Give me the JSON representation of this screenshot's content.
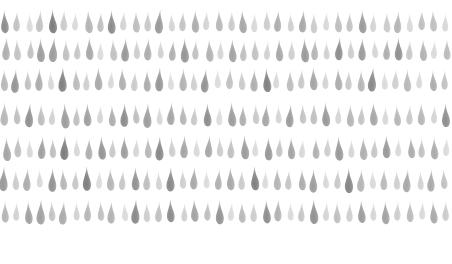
{
  "artwork": {
    "title": "Watercolor raindrop repeat pattern",
    "medium": "watercolor",
    "motif_name": "teardrop",
    "background_color": "#ffffff",
    "canvas": {
      "width": 452,
      "height": 264
    },
    "grid": {
      "columns": 38,
      "rows": 7,
      "column_spacing": 11.9,
      "row_spacing": 30.2,
      "first_row_center_y": 22,
      "first_column_center_x": 5
    },
    "motif": {
      "base_width": 9,
      "base_height": 24,
      "tip_direction": "up",
      "bulb_direction": "down"
    },
    "palette": {
      "lightest": "#dcdcdc",
      "light": "#cfcfcf",
      "mid_light": "#bdbdbd",
      "mid": "#ababab",
      "mid_dark": "#9a9a9a",
      "dark": "#8a8a8a",
      "darkest": "#7b7b7b"
    },
    "rows": [
      {
        "index": 0,
        "center_y": 22,
        "x_offset": 0,
        "shades": [
          5,
          2,
          1,
          3,
          6,
          2,
          1,
          4,
          2,
          5,
          1,
          3,
          2,
          6,
          1,
          2,
          4,
          1,
          3,
          2,
          5,
          1,
          2,
          3,
          1,
          4,
          2,
          1,
          3,
          2,
          5,
          1,
          2,
          4,
          1,
          2,
          3,
          1
        ],
        "sizes": [
          1.0,
          0.88,
          0.82,
          0.95,
          1.05,
          0.9,
          0.8,
          1.0,
          0.86,
          1.02,
          0.84,
          0.93,
          0.88,
          1.06,
          0.8,
          0.87,
          0.98,
          0.82,
          0.92,
          0.86,
          1.0,
          0.83,
          0.88,
          0.94,
          0.81,
          0.97,
          0.87,
          0.8,
          0.92,
          0.85,
          1.0,
          0.82,
          0.88,
          0.96,
          0.83,
          0.87,
          0.93,
          0.8
        ],
        "tilts": [
          -3,
          2,
          -1,
          4,
          -2,
          1,
          3,
          -4,
          2,
          -1,
          3,
          -2,
          1,
          4,
          -3,
          2,
          -1,
          3,
          -2,
          1,
          -4,
          2,
          -1,
          3,
          -2,
          4,
          -1,
          2,
          -3,
          1,
          -2,
          3,
          -1,
          4,
          -2,
          1,
          -3,
          2
        ]
      },
      {
        "index": 1,
        "center_y": 50,
        "x_offset": 1,
        "shades": [
          4,
          3,
          2,
          5,
          6,
          3,
          2,
          4,
          1,
          3,
          5,
          2,
          4,
          1,
          3,
          6,
          2,
          4,
          1,
          5,
          2,
          3,
          1,
          4,
          2,
          6,
          3,
          1,
          5,
          2,
          4,
          1,
          3,
          5,
          2,
          4,
          1,
          3
        ],
        "sizes": [
          1.0,
          0.92,
          0.85,
          1.04,
          1.08,
          0.9,
          0.84,
          0.99,
          0.82,
          0.94,
          1.02,
          0.86,
          0.97,
          0.8,
          0.9,
          1.06,
          0.85,
          0.98,
          0.83,
          1.0,
          0.87,
          0.92,
          0.81,
          0.96,
          0.86,
          1.05,
          0.91,
          0.8,
          1.0,
          0.85,
          0.97,
          0.82,
          0.9,
          1.01,
          0.86,
          0.95,
          0.81,
          0.9
        ],
        "tilts": [
          2,
          -3,
          1,
          -2,
          4,
          -1,
          3,
          -2,
          1,
          -4,
          2,
          -1,
          3,
          -2,
          4,
          -1,
          2,
          -3,
          1,
          -2,
          3,
          -1,
          4,
          -2,
          1,
          -3,
          2,
          -1,
          3,
          -2,
          1,
          -4,
          2,
          -1,
          3,
          -2,
          4,
          -1
        ]
      },
      {
        "index": 2,
        "center_y": 80,
        "x_offset": -1,
        "shades": [
          3,
          5,
          2,
          4,
          1,
          6,
          3,
          2,
          5,
          1,
          4,
          2,
          3,
          6,
          1,
          4,
          2,
          5,
          1,
          3,
          2,
          4,
          6,
          1,
          3,
          2,
          5,
          1,
          4,
          2,
          3,
          6,
          1,
          2,
          4,
          1,
          3,
          2
        ],
        "sizes": [
          0.95,
          1.03,
          0.86,
          0.98,
          0.81,
          1.07,
          0.92,
          0.84,
          1.0,
          0.8,
          0.96,
          0.87,
          0.93,
          1.05,
          0.82,
          0.99,
          0.85,
          1.01,
          0.83,
          0.91,
          0.86,
          0.97,
          1.04,
          0.8,
          0.92,
          0.85,
          1.0,
          0.82,
          0.96,
          0.86,
          0.93,
          1.06,
          0.81,
          0.87,
          0.98,
          0.8,
          0.91,
          0.85
        ],
        "tilts": [
          -2,
          3,
          -1,
          2,
          -4,
          1,
          -3,
          2,
          -1,
          4,
          -2,
          3,
          -1,
          2,
          -3,
          1,
          -2,
          4,
          -1,
          3,
          -2,
          1,
          -4,
          2,
          -1,
          3,
          -2,
          1,
          -3,
          2,
          -1,
          4,
          -2,
          3,
          -1,
          2,
          -3,
          1
        ]
      },
      {
        "index": 3,
        "center_y": 115,
        "x_offset": 0,
        "shades": [
          4,
          2,
          5,
          3,
          1,
          6,
          2,
          4,
          1,
          3,
          5,
          2,
          6,
          1,
          4,
          3,
          2,
          5,
          1,
          6,
          3,
          2,
          4,
          1,
          5,
          2,
          3,
          6,
          1,
          4,
          2,
          5,
          1,
          3,
          2,
          4,
          1,
          6
        ],
        "sizes": [
          1.02,
          0.87,
          1.05,
          0.93,
          0.82,
          1.1,
          0.86,
          1.0,
          0.8,
          0.92,
          1.03,
          0.85,
          1.08,
          0.81,
          0.99,
          0.9,
          0.84,
          1.01,
          0.83,
          1.06,
          0.91,
          0.86,
          0.97,
          0.8,
          1.0,
          0.85,
          0.92,
          1.05,
          0.82,
          0.98,
          0.86,
          1.02,
          0.81,
          0.9,
          0.85,
          0.96,
          0.8,
          1.04
        ],
        "tilts": [
          1,
          -2,
          3,
          -1,
          4,
          -3,
          2,
          -1,
          3,
          -2,
          1,
          -4,
          2,
          -1,
          3,
          -2,
          4,
          -1,
          2,
          -3,
          1,
          -2,
          3,
          -1,
          4,
          -2,
          1,
          -3,
          2,
          -1,
          3,
          -2,
          1,
          -4,
          2,
          -1,
          3,
          -2
        ]
      },
      {
        "index": 4,
        "center_y": 148,
        "x_offset": 1,
        "shades": [
          5,
          3,
          1,
          4,
          2,
          6,
          1,
          3,
          5,
          2,
          4,
          1,
          3,
          6,
          2,
          5,
          1,
          4,
          2,
          3,
          6,
          1,
          5,
          2,
          4,
          1,
          3,
          2,
          6,
          1,
          4,
          2,
          5,
          1,
          3,
          2,
          4,
          1
        ],
        "sizes": [
          1.04,
          0.92,
          0.81,
          0.99,
          0.86,
          1.08,
          0.8,
          0.93,
          1.02,
          0.85,
          0.98,
          0.82,
          0.91,
          1.06,
          0.86,
          1.0,
          0.81,
          0.97,
          0.85,
          0.92,
          1.05,
          0.8,
          1.01,
          0.86,
          0.96,
          0.82,
          0.9,
          0.85,
          1.07,
          0.81,
          0.99,
          0.86,
          1.0,
          0.8,
          0.92,
          0.85,
          0.97,
          0.82
        ],
        "tilts": [
          -3,
          1,
          -2,
          4,
          -1,
          2,
          -3,
          1,
          -4,
          2,
          -1,
          3,
          -2,
          1,
          -3,
          2,
          -1,
          4,
          -2,
          1,
          -3,
          2,
          -1,
          3,
          -2,
          4,
          -1,
          2,
          -3,
          1,
          -2,
          3,
          -1,
          2,
          -4,
          1,
          -2,
          3
        ]
      },
      {
        "index": 5,
        "center_y": 180,
        "x_offset": -1,
        "shades": [
          6,
          2,
          4,
          1,
          5,
          3,
          2,
          6,
          1,
          4,
          2,
          5,
          3,
          1,
          6,
          2,
          4,
          1,
          3,
          5,
          2,
          6,
          1,
          4,
          2,
          3,
          5,
          1,
          2,
          6,
          4,
          1,
          3,
          2,
          5,
          1,
          4,
          2
        ],
        "sizes": [
          1.09,
          0.86,
          0.99,
          0.8,
          1.03,
          0.91,
          0.85,
          1.07,
          0.81,
          0.98,
          0.86,
          1.01,
          0.92,
          0.82,
          1.06,
          0.85,
          0.97,
          0.8,
          0.9,
          1.0,
          0.86,
          1.05,
          0.81,
          0.96,
          0.85,
          0.92,
          1.02,
          0.8,
          0.86,
          1.08,
          0.98,
          0.82,
          0.91,
          0.85,
          1.0,
          0.81,
          0.97,
          0.86
        ],
        "tilts": [
          2,
          -1,
          3,
          -2,
          1,
          -4,
          2,
          -1,
          3,
          -2,
          4,
          -1,
          2,
          -3,
          1,
          -2,
          3,
          -1,
          4,
          -2,
          1,
          -3,
          2,
          -1,
          3,
          -2,
          1,
          -4,
          2,
          -1,
          3,
          -2,
          1,
          -2,
          4,
          -1,
          2,
          -3
        ]
      },
      {
        "index": 6,
        "center_y": 212,
        "x_offset": 0,
        "shades": [
          3,
          1,
          4,
          6,
          2,
          5,
          1,
          3,
          2,
          4,
          1,
          6,
          2,
          3,
          5,
          1,
          4,
          2,
          6,
          1,
          3,
          2,
          5,
          4,
          1,
          2,
          6,
          1,
          3,
          2,
          4,
          1,
          5,
          2,
          3,
          1,
          4,
          2
        ],
        "sizes": [
          0.93,
          0.81,
          0.99,
          1.1,
          0.86,
          1.02,
          0.8,
          0.92,
          0.85,
          0.97,
          0.82,
          1.07,
          0.86,
          0.91,
          1.0,
          0.8,
          0.98,
          0.85,
          1.05,
          0.81,
          0.9,
          0.86,
          1.01,
          0.96,
          0.8,
          0.85,
          1.08,
          0.82,
          0.92,
          0.86,
          0.99,
          0.81,
          1.0,
          0.85,
          0.91,
          0.8,
          0.97,
          0.86
        ],
        "tilts": [
          -1,
          2,
          -3,
          1,
          -2,
          4,
          -1,
          3,
          -2,
          1,
          -4,
          2,
          -1,
          3,
          -2,
          1,
          -3,
          2,
          -1,
          4,
          -2,
          1,
          -3,
          2,
          -1,
          3,
          -2,
          4,
          -1,
          2,
          -3,
          1,
          -2,
          3,
          -1,
          2,
          -4,
          1
        ]
      }
    ]
  }
}
